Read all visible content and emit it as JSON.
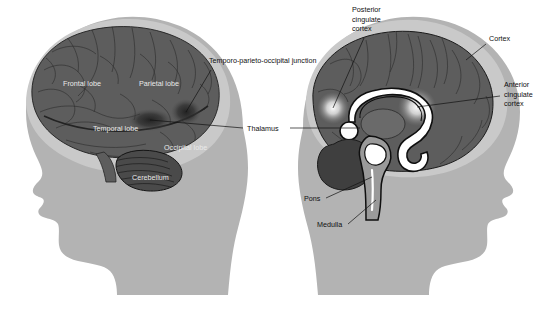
{
  "figure": {
    "background_color": "#ffffff",
    "width": 546,
    "height": 314
  },
  "palette": {
    "head_silhouette": "#b3b3b3",
    "skull_halo": "#c9c9c9",
    "brain_gray": "#5d5d5d",
    "brain_gray_dark": "#4a4a4a",
    "cerebellum": "#3f3f3f",
    "activation_dark": "#2a2a2a",
    "activation_glow": "#f2f2f2",
    "corpus_callosum": "#ffffff",
    "outline": "#141414",
    "label_text": "#111111",
    "label_text_on_brain": "#e9e9e9",
    "leader_line": "#111111"
  },
  "panels": [
    {
      "id": "left-panel",
      "name": "lateral-view",
      "description": "Left-facing head profile with lateral view of the brain",
      "facing": "left"
    },
    {
      "id": "right-panel",
      "name": "midsagittal-view",
      "description": "Right-facing head profile with midsagittal section of the brain",
      "facing": "right"
    }
  ],
  "labels": {
    "frontal_lobe": "Frontal lobe",
    "parietal_lobe": "Parietal lobe",
    "temporal_lobe": "Temporal lobe",
    "occipital_lobe": "Occipital lobe",
    "cerebellum": "Cerebellum",
    "tpj": "Temporo-parieto-occipital junction",
    "thalamus": "Thalamus",
    "posterior_cingulate_line1": "Posterior",
    "posterior_cingulate_line2": "cingulate",
    "posterior_cingulate_line3": "cortex",
    "cortex": "Cortex",
    "anterior_cingulate_line1": "Anterior",
    "anterior_cingulate_line2": "cingulate",
    "anterior_cingulate_line3": "cortex",
    "pons": "Pons",
    "medulla": "Medulla"
  },
  "structures": [
    {
      "name": "frontal-lobe",
      "panel": "lateral-view",
      "label": "Frontal lobe"
    },
    {
      "name": "parietal-lobe",
      "panel": "lateral-view",
      "label": "Parietal lobe"
    },
    {
      "name": "temporal-lobe",
      "panel": "lateral-view",
      "label": "Temporal lobe"
    },
    {
      "name": "occipital-lobe",
      "panel": "lateral-view",
      "label": "Occipital lobe"
    },
    {
      "name": "cerebellum",
      "panel": "lateral-view",
      "label": "Cerebellum"
    },
    {
      "name": "temporo-parieto-occipital-junction",
      "panel": "lateral-view",
      "label": "Temporo-parieto-occipital junction"
    },
    {
      "name": "thalamus",
      "panel": "both",
      "label": "Thalamus"
    },
    {
      "name": "posterior-cingulate-cortex",
      "panel": "midsagittal-view",
      "label": "Posterior cingulate cortex"
    },
    {
      "name": "anterior-cingulate-cortex",
      "panel": "midsagittal-view",
      "label": "Anterior cingulate cortex"
    },
    {
      "name": "cortex",
      "panel": "midsagittal-view",
      "label": "Cortex"
    },
    {
      "name": "pons",
      "panel": "midsagittal-view",
      "label": "Pons"
    },
    {
      "name": "medulla",
      "panel": "midsagittal-view",
      "label": "Medulla"
    }
  ]
}
